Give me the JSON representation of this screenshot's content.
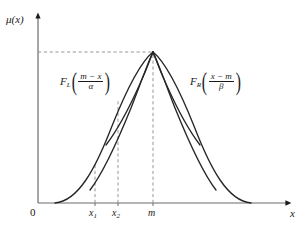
{
  "figure": {
    "background_color": "#ffffff",
    "ink_color": "#1a1a1a"
  },
  "axes": {
    "y_label": "μ(x)",
    "x_label": "x",
    "origin_label": "0",
    "x_axis_name": "horizontal-axis",
    "y_axis_name": "vertical-axis"
  },
  "ticks": [
    {
      "name": "tick-x1",
      "base": "x",
      "sub": "1",
      "x_px": 95
    },
    {
      "name": "tick-x2",
      "base": "x",
      "sub": "2",
      "x_px": 118
    },
    {
      "name": "tick-m",
      "base": "m",
      "sub": "",
      "x_px": 153
    }
  ],
  "annotations": {
    "left_formula": {
      "function_name": "F",
      "subscript": "L",
      "numerator": "m − x",
      "denominator": "α",
      "open_paren": "(",
      "close_paren": ")"
    },
    "right_formula": {
      "function_name": "F",
      "subscript": "R",
      "numerator": "x − m",
      "denominator": "β",
      "open_paren": "(",
      "close_paren": ")"
    }
  },
  "chart_data": {
    "type": "line",
    "title": "",
    "xlabel": "x",
    "ylabel": "μ(x)",
    "xlim": [
      0,
      1
    ],
    "ylim": [
      0,
      1
    ],
    "grid": false,
    "legend": "none",
    "peak": {
      "x_px": 153,
      "y_px": 52,
      "value": 1.0
    },
    "baseline_y_px": 203,
    "dashed_lines": [
      {
        "name": "peak-horizontal-guide",
        "orientation": "horizontal",
        "y_px": 52,
        "x_from_px": 38,
        "x_to_px": 153
      },
      {
        "name": "x1-vertical-guide",
        "orientation": "vertical",
        "x_px": 95,
        "y_from_px": 203,
        "y_to_px": 163
      },
      {
        "name": "x2-vertical-guide",
        "orientation": "vertical",
        "x_px": 118,
        "y_from_px": 203,
        "y_to_px": 100
      },
      {
        "name": "m-vertical-guide",
        "orientation": "vertical",
        "x_px": 153,
        "y_from_px": 203,
        "y_to_px": 52
      }
    ],
    "series": [
      {
        "name": "outer-left-branch",
        "side": "left",
        "spread": "wide",
        "path": "M 55 203 C 78 201 95 170 112 126 C 128 86 143 60 153 52"
      },
      {
        "name": "middle-left-branch",
        "side": "left",
        "spread": "medium",
        "path": "M 90 190 C 104 172 118 140 131 108 C 141 82 149 60 153 52"
      },
      {
        "name": "inner-left-branch",
        "side": "left",
        "spread": "narrow",
        "path": "M 106 145 C 119 128 130 106 139 86 C 147 69 151 57 153 52"
      },
      {
        "name": "inner-right-branch",
        "side": "right",
        "spread": "narrow",
        "path": "M 153 52 C 155 57 159 69 167 86 C 176 106 187 128 200 145"
      },
      {
        "name": "middle-right-branch",
        "side": "right",
        "spread": "medium",
        "path": "M 153 52 C 157 60 165 82 175 108 C 188 140 202 172 216 190"
      },
      {
        "name": "outer-right-branch",
        "side": "right",
        "spread": "wide",
        "path": "M 153 52 C 163 60 178 86 194 126 C 211 170 228 201 251 203"
      }
    ]
  }
}
